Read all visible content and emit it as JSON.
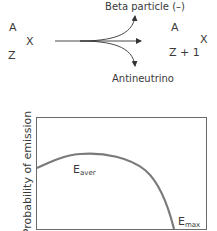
{
  "decay_equation": {
    "parent": {
      "mass_number": "A",
      "atomic_number": "Z",
      "symbol": "X"
    },
    "daughter": {
      "mass_number": "A",
      "atomic_number": "Z + 1",
      "symbol": "X"
    },
    "upper_branch_label": "Beta particle (–)",
    "lower_branch_label": "Antineutrino"
  },
  "energy_graph": {
    "ylabel": "Probability of emission",
    "eaver_label": {
      "main": "E",
      "sub": "aver"
    },
    "emax_label": {
      "main": "E",
      "sub": "max"
    }
  },
  "colors": {
    "text": "#3a3a3a",
    "line": "#333333",
    "curve": "#7a7a7a",
    "frame": "#6a6a6a"
  }
}
